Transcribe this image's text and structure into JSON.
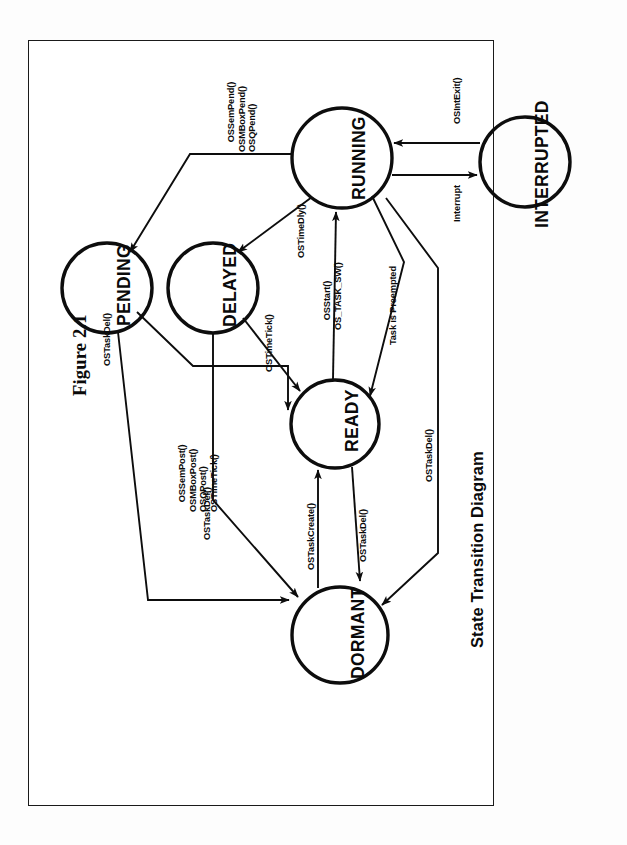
{
  "figure": {
    "title": "Figure 2.1",
    "caption": "State Transition Diagram",
    "orientation": "rotated-90-ccw",
    "frame": {
      "border_color": "#1a1a1a",
      "background": "#ffffff"
    }
  },
  "chart_data": {
    "type": "diagram",
    "title": "Figure 2.1",
    "subtitle": "State Transition Diagram",
    "nodes": [
      {
        "id": "running",
        "label": "RUNNING",
        "cx": 342,
        "cy": 158,
        "r": 50
      },
      {
        "id": "interrupted",
        "label": "INTERRUPTED",
        "cx": 525,
        "cy": 162,
        "r": 45
      },
      {
        "id": "pending",
        "label": "PENDING",
        "cx": 107,
        "cy": 288,
        "r": 45
      },
      {
        "id": "delayed",
        "label": "DELAYED",
        "cx": 213,
        "cy": 288,
        "r": 45
      },
      {
        "id": "ready",
        "label": "READY",
        "cx": 335,
        "cy": 424,
        "r": 44
      },
      {
        "id": "dormant",
        "label": "DORMANT",
        "cx": 340,
        "cy": 635,
        "r": 48
      }
    ],
    "edges": [
      {
        "from": "running",
        "to": "pending",
        "label": "OSSemPend()\nOSMBoxPend()\nOSQPend()"
      },
      {
        "from": "running",
        "to": "delayed",
        "label": "OSTimeDly()"
      },
      {
        "from": "running",
        "to": "interrupted",
        "label": "Interrupt"
      },
      {
        "from": "interrupted",
        "to": "running",
        "label": "OSIntExit()"
      },
      {
        "from": "ready",
        "to": "running",
        "label": "OSStart()\nOS_TASK_SW()"
      },
      {
        "from": "running",
        "to": "ready",
        "label": "Task is Preempted"
      },
      {
        "from": "delayed",
        "to": "ready",
        "label": "OSTimeTick()"
      },
      {
        "from": "pending",
        "to": "ready",
        "label": "OSSemPost()\nOSMBoxPost()\nOSQPost()\nOSTimeTick()"
      },
      {
        "from": "pending",
        "to": "dormant",
        "label": "OSTaskDel()"
      },
      {
        "from": "delayed",
        "to": "dormant",
        "label": "OSTaskDel()"
      },
      {
        "from": "ready",
        "to": "dormant",
        "label": "OSTaskDel()"
      },
      {
        "from": "dormant",
        "to": "ready",
        "label": "OSTaskCreate()"
      },
      {
        "from": "running",
        "to": "dormant",
        "label": "OSTaskDel()"
      }
    ]
  },
  "labels": {
    "running": "RUNNING",
    "interrupted": "INTERRUPTED",
    "pending": "PENDING",
    "delayed": "DELAYED",
    "ready": "READY",
    "dormant": "DORMANT",
    "run_to_pend": "OSSemPend()\nOSMBoxPend()\nOSQPend()",
    "run_to_delay": "OSTimeDly()",
    "run_to_int": "Interrupt",
    "int_to_run": "OSIntExit()",
    "ready_to_run": "OSStart()\nOS_TASK_SW()",
    "run_to_ready": "Task is Preempted",
    "delay_to_ready": "OSTimeTick()",
    "pend_to_ready": "OSSemPost()\nOSMBoxPost()\nOSQPost()\nOSTimeTick()",
    "pend_to_dorm": "OSTaskDel()",
    "delay_to_dorm": "OSTaskDel()",
    "ready_to_dorm": "OSTaskDel()",
    "dorm_to_ready": "OSTaskCreate()",
    "run_to_dorm": "OSTaskDel()"
  }
}
